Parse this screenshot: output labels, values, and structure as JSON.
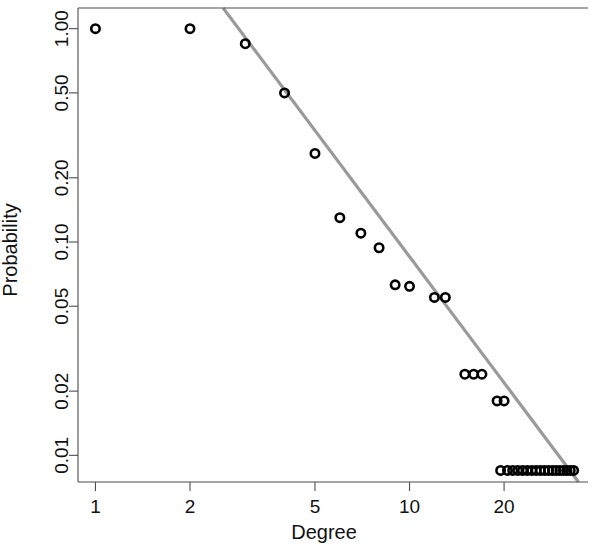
{
  "chart_data": {
    "type": "scatter",
    "title": "",
    "xlabel": "Degree",
    "ylabel": "Probability",
    "xscale": "log",
    "yscale": "log",
    "xlim": [
      0.88,
      37.0
    ],
    "ylim": [
      0.0075,
      1.25
    ],
    "grid": false,
    "legend": "none",
    "xticks": [
      1,
      2,
      5,
      10,
      20
    ],
    "xtick_labels": [
      "1",
      "2",
      "5",
      "10",
      "20"
    ],
    "yticks": [
      0.01,
      0.02,
      0.05,
      0.1,
      0.2,
      0.5,
      1.0
    ],
    "ytick_labels": [
      "0.01",
      "0.02",
      "0.05",
      "0.10",
      "0.20",
      "0.50",
      "1.00"
    ],
    "marker": "open-circle",
    "marker_color": "#000000",
    "fit_line_color": "#9a9a9a",
    "series": [
      {
        "name": "Cumulative degree distribution",
        "x": [
          1,
          2,
          3,
          4,
          5,
          6,
          7,
          8,
          9,
          10,
          12,
          13,
          15,
          16,
          17,
          19,
          20,
          19.5,
          20.5,
          21.3,
          22.1,
          22.9,
          23.7,
          24.5,
          25.3,
          26.1,
          26.9,
          27.7,
          28.5,
          29.3,
          30.1,
          30.9,
          31.7,
          32.5,
          33.3
        ],
        "y": [
          1.0,
          1.0,
          0.85,
          0.5,
          0.26,
          0.13,
          0.11,
          0.094,
          0.063,
          0.062,
          0.055,
          0.055,
          0.024,
          0.024,
          0.024,
          0.018,
          0.018,
          0.0085,
          0.0085,
          0.0085,
          0.0085,
          0.0085,
          0.0085,
          0.0085,
          0.0085,
          0.0085,
          0.0085,
          0.0085,
          0.0085,
          0.0085,
          0.0085,
          0.0085,
          0.0085,
          0.0085,
          0.0085
        ]
      }
    ],
    "fit_line": {
      "name": "power-law fit",
      "x_start": 2.55,
      "y_start": 1.25,
      "x_end": 34.5,
      "y_end": 0.0075
    }
  }
}
